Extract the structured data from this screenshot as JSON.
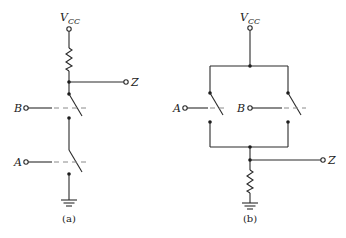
{
  "circuit_a": {
    "supply_label": "V",
    "supply_subscript": "CC",
    "output_label": "Z",
    "input_top_label": "B",
    "input_bottom_label": "A",
    "caption": "(a)",
    "topology": "series switches (NAND-type): resistor pull-up to Vcc, switches B and A in series to ground, output Z at junction"
  },
  "circuit_b": {
    "supply_label": "V",
    "supply_subscript": "CC",
    "output_label": "Z",
    "input_left_label": "A",
    "input_right_label": "B",
    "caption": "(b)",
    "topology": "parallel switches (OR-type): switches A and B in parallel from Vcc, resistor pull-down to ground, output Z at junction"
  }
}
